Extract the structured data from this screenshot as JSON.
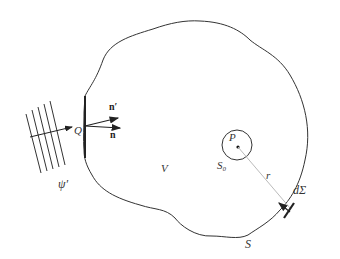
{
  "diagram": {
    "type": "kirchhoff-integral-geometry",
    "labels": {
      "incident_wave": "ψ′",
      "point_q": "Q",
      "normal_prime": "n′",
      "normal": "n",
      "volume": "V",
      "point_p": "P",
      "small_sphere": "S₀",
      "radius": "r",
      "surface_element": "dΣ",
      "surface": "S"
    },
    "colors": {
      "stroke": "#333333",
      "ray": "#bbbbbb",
      "background": "#ffffff"
    },
    "elements": {
      "wavefront_count": 5,
      "arrows": [
        "incident-ray",
        "normal-n-prime",
        "normal-n",
        "surface-element-normal"
      ]
    }
  }
}
